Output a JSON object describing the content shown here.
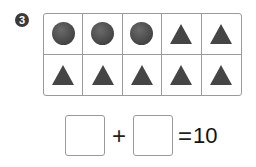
{
  "problem": {
    "number": "3",
    "grid": {
      "rows": [
        [
          "circle",
          "circle",
          "circle",
          "triangle",
          "triangle"
        ],
        [
          "triangle",
          "triangle",
          "triangle",
          "triangle",
          "triangle"
        ]
      ]
    },
    "equation": {
      "box1": "",
      "operator": "+",
      "box2": "",
      "equals": "=",
      "result": "10"
    }
  }
}
